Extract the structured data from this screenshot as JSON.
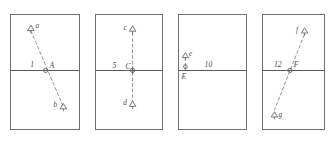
{
  "figure": {
    "background_color": "#ffffff",
    "line_color": "#6e6e6e",
    "dash_color": "#8a8a8a",
    "text_color": "#4a4a4a",
    "panel_count": 4
  },
  "panels": [
    {
      "id": "panel-1",
      "frame": {
        "x": 10,
        "y": 14,
        "width": 70,
        "height": 116
      },
      "midline_y": 70,
      "line_style": "dashed",
      "orientation": "diagonal-down-right",
      "value_label": "1",
      "node_label": "A",
      "markers": [
        {
          "id": "a",
          "label": "a",
          "shape": "triangle",
          "position": "upper-left"
        },
        {
          "id": "b",
          "label": "b",
          "shape": "triangle",
          "position": "lower-right"
        }
      ]
    },
    {
      "id": "panel-2",
      "frame": {
        "x": 95,
        "y": 14,
        "width": 68,
        "height": 116
      },
      "midline_y": 70,
      "line_style": "dashed",
      "orientation": "vertical",
      "value_label": "5",
      "node_label": "C",
      "markers": [
        {
          "id": "c",
          "label": "c",
          "shape": "triangle",
          "position": "top"
        },
        {
          "id": "d",
          "label": "d",
          "shape": "triangle",
          "position": "bottom"
        }
      ]
    },
    {
      "id": "panel-3",
      "frame": {
        "x": 178,
        "y": 14,
        "width": 69,
        "height": 116
      },
      "midline_y": 70,
      "line_style": "dashed",
      "orientation": "vertical-short",
      "value_label": "10",
      "node_label": "E",
      "markers": [
        {
          "id": "e",
          "label": "e",
          "shape": "triangle",
          "position": "above-midline"
        }
      ]
    },
    {
      "id": "panel-4",
      "frame": {
        "x": 262,
        "y": 14,
        "width": 63,
        "height": 116
      },
      "midline_y": 70,
      "line_style": "dashed",
      "orientation": "diagonal-up-right",
      "value_label": "12",
      "node_label": "F",
      "markers": [
        {
          "id": "f",
          "label": "f",
          "shape": "triangle",
          "position": "upper-right"
        },
        {
          "id": "g",
          "label": "g",
          "shape": "triangle",
          "position": "lower-left"
        }
      ]
    }
  ],
  "labels": {
    "p1_value": "1",
    "p1_node": "A",
    "p1_marker_a": "a",
    "p1_marker_b": "b",
    "p2_value": "5",
    "p2_node": "C",
    "p2_marker_c": "c",
    "p2_marker_d": "d",
    "p3_value": "10",
    "p3_node": "E",
    "p3_marker_e": "e",
    "p4_value": "12",
    "p4_node": "F",
    "p4_marker_f": "f",
    "p4_marker_g": "g"
  }
}
